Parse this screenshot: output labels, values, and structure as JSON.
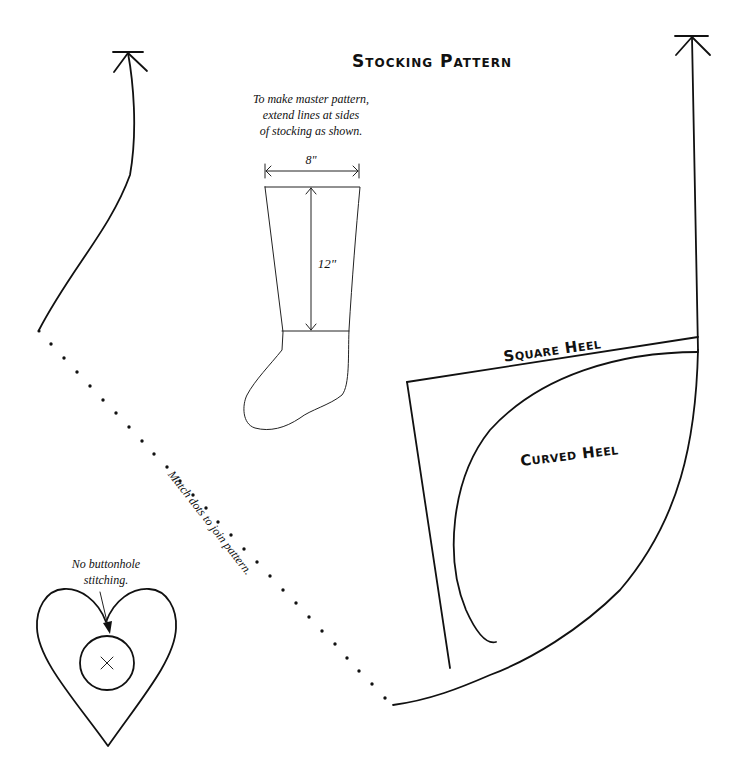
{
  "title": "Stocking Pattern",
  "master_note": {
    "lines": [
      "To make master pattern,",
      "extend lines at sides",
      "of stocking as shown."
    ]
  },
  "stocking_diagram": {
    "width_label": "8\"",
    "length_label": "12\""
  },
  "heel_labels": {
    "square": "Square Heel",
    "curved": "Curved Heel"
  },
  "join_note": "Match dots to join pattern.",
  "heart_note": {
    "lines": [
      "No buttonhole",
      "stitching."
    ]
  },
  "colors": {
    "line": "#111111",
    "background": "#ffffff"
  }
}
